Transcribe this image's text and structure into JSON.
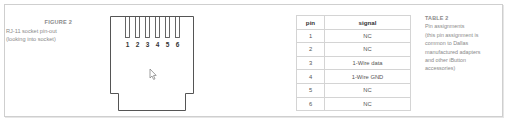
{
  "figure": {
    "title": "FIGURE 2",
    "caption_lines": [
      "RJ-11 socket pin-out",
      "(looking into socket)"
    ],
    "pin_labels": [
      "1",
      "2",
      "3",
      "4",
      "5",
      "6"
    ]
  },
  "table": {
    "headers": {
      "pin": "pin",
      "signal": "signal"
    },
    "rows": [
      {
        "pin": "1",
        "signal": "NC"
      },
      {
        "pin": "2",
        "signal": "NC"
      },
      {
        "pin": "3",
        "signal": "1-Wire data"
      },
      {
        "pin": "4",
        "signal": "1-Wire GND"
      },
      {
        "pin": "5",
        "signal": "NC"
      },
      {
        "pin": "6",
        "signal": "NC"
      }
    ]
  },
  "table_caption": {
    "title": "TABLE 2",
    "lines": [
      "Pin assignments",
      "(this pin assignment is",
      "common to Dallas",
      "manufactured adapters",
      "and other iButton",
      "accessories)"
    ]
  },
  "colors": {
    "frame_border": "#cfcfcf",
    "caption_text": "#8a8a8a",
    "drawing_stroke": "#555555",
    "table_border": "#d4d4d4"
  }
}
